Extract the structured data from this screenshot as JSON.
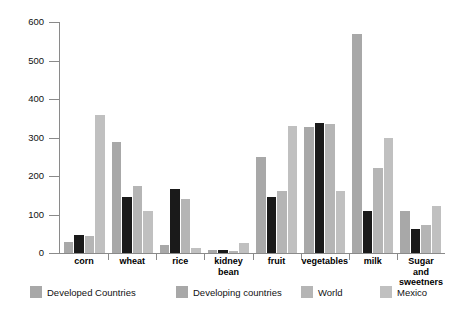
{
  "chart_data": {
    "type": "bar",
    "title": "",
    "subtitle": "",
    "xlabel": "",
    "ylabel": "",
    "ylim": [
      0,
      600
    ],
    "yticks": [
      0,
      100,
      200,
      300,
      400,
      500,
      600
    ],
    "grid": false,
    "legend_position": "bottom",
    "categories": [
      "corn",
      "wheat",
      "rice",
      "kidney bean",
      "fruit",
      "vegetables",
      "milk",
      "Sugar and sweetners"
    ],
    "category_lines": [
      [
        "corn"
      ],
      [
        "wheat"
      ],
      [
        "rice"
      ],
      [
        "kidney",
        "bean"
      ],
      [
        "fruit"
      ],
      [
        "vegetables"
      ],
      [
        "milk"
      ],
      [
        "Sugar",
        "and",
        "sweetners"
      ]
    ],
    "series": [
      {
        "name": "Developed Countries",
        "color": "#a8a8a8",
        "values": [
          28,
          288,
          20,
          8,
          250,
          327,
          570,
          110
        ]
      },
      {
        "name": "Developing countries",
        "color": "#1a1a1a",
        "values": [
          48,
          145,
          165,
          7,
          145,
          337,
          110,
          62
        ]
      },
      {
        "name": "World",
        "color": "#b5b5b5",
        "values": [
          45,
          175,
          140,
          5,
          160,
          335,
          220,
          72
        ]
      },
      {
        "name": "Mexico",
        "color": "#c0c0c0",
        "values": [
          358,
          108,
          13,
          25,
          330,
          162,
          300,
          122
        ]
      }
    ]
  },
  "axis": {
    "y_tick_labels": [
      "600",
      "500",
      "400",
      "300",
      "200",
      "100",
      "0"
    ]
  },
  "legend": {
    "items": [
      {
        "label": "Developed Countries",
        "color": "#a8a8a8"
      },
      {
        "label": "Developing countries",
        "color": "#a8a8a8"
      },
      {
        "label": "World",
        "color": "#b5b5b5"
      },
      {
        "label": "Mexico",
        "color": "#c0c0c0"
      }
    ]
  }
}
